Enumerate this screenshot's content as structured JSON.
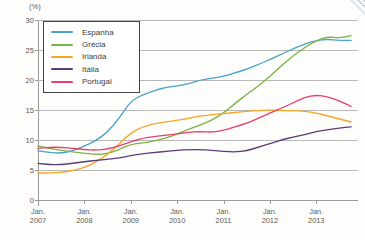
{
  "credit": "Gráfico: © DAE",
  "unit_label": "(%)",
  "chart_data": {
    "type": "line",
    "title": "",
    "subtitle": "",
    "xlabel": "",
    "ylabel": "(%)",
    "ylim": [
      0,
      30
    ],
    "y_ticks": [
      0,
      5,
      10,
      15,
      20,
      25,
      30
    ],
    "grid": true,
    "legend_position": "top-left",
    "x_tick_labels": [
      [
        "Jan.",
        "2007"
      ],
      [
        "Jan.",
        "2008"
      ],
      [
        "Jan.",
        "2009"
      ],
      [
        "Jan.",
        "2010"
      ],
      [
        "Jan.",
        "2011"
      ],
      [
        "Jan.",
        "2012"
      ],
      [
        "Jan.",
        "2013"
      ]
    ],
    "x": [
      2007.0,
      2007.25,
      2007.5,
      2007.75,
      2008.0,
      2008.25,
      2008.5,
      2008.75,
      2009.0,
      2009.25,
      2009.5,
      2009.75,
      2010.0,
      2010.25,
      2010.5,
      2010.75,
      2011.0,
      2011.25,
      2011.5,
      2011.75,
      2012.0,
      2012.25,
      2012.5,
      2012.75,
      2013.0,
      2013.25,
      2013.5,
      2013.75
    ],
    "xlim": [
      2007.0,
      2013.9
    ],
    "series": [
      {
        "name": "Espanha",
        "color": "#4aa3c8",
        "values": [
          8.2,
          7.9,
          7.8,
          8.2,
          9.0,
          9.9,
          11.3,
          13.6,
          16.5,
          17.5,
          18.2,
          18.8,
          19.0,
          19.4,
          20.0,
          20.3,
          20.6,
          21.2,
          21.8,
          22.6,
          23.4,
          24.3,
          25.2,
          26.0,
          26.6,
          26.8,
          26.6,
          26.6
        ]
      },
      {
        "name": "Grécia",
        "color": "#7cb342",
        "values": [
          9.0,
          8.6,
          8.3,
          8.0,
          7.8,
          7.6,
          7.7,
          8.4,
          9.3,
          9.5,
          9.8,
          10.3,
          11.0,
          11.8,
          12.5,
          13.3,
          14.5,
          16.1,
          17.6,
          19.0,
          20.6,
          22.4,
          24.0,
          25.4,
          26.6,
          27.2,
          27.0,
          27.4
        ]
      },
      {
        "name": "Irlanda",
        "color": "#f5a623",
        "values": [
          4.5,
          4.5,
          4.6,
          4.9,
          5.4,
          6.3,
          7.6,
          9.3,
          11.2,
          12.2,
          12.7,
          13.0,
          13.3,
          13.6,
          14.0,
          14.2,
          14.4,
          14.6,
          14.8,
          14.9,
          15.0,
          14.9,
          14.9,
          14.8,
          14.5,
          14.0,
          13.5,
          13.0
        ]
      },
      {
        "name": "Itália",
        "color": "#5c3d7a",
        "values": [
          6.1,
          5.9,
          5.9,
          6.1,
          6.4,
          6.6,
          6.8,
          7.0,
          7.4,
          7.7,
          7.9,
          8.1,
          8.3,
          8.4,
          8.4,
          8.3,
          8.1,
          8.0,
          8.2,
          8.8,
          9.4,
          10.0,
          10.5,
          10.9,
          11.4,
          11.7,
          12.0,
          12.2
        ]
      },
      {
        "name": "Portugal",
        "color": "#e8416f",
        "values": [
          8.6,
          8.8,
          8.8,
          8.6,
          8.4,
          8.3,
          8.5,
          9.0,
          9.7,
          10.3,
          10.6,
          10.8,
          11.0,
          11.3,
          11.4,
          11.3,
          11.6,
          12.2,
          12.8,
          13.6,
          14.5,
          15.3,
          16.2,
          17.1,
          17.5,
          17.2,
          16.5,
          15.6
        ]
      }
    ]
  },
  "legend": {
    "items": [
      {
        "label": "Espanha",
        "color": "#4aa3c8"
      },
      {
        "label": "Grécia",
        "color": "#7cb342"
      },
      {
        "label": "Irlanda",
        "color": "#f5a623"
      },
      {
        "label": "Itália",
        "color": "#5c3d7a"
      },
      {
        "label": "Portugal",
        "color": "#e8416f"
      }
    ]
  }
}
